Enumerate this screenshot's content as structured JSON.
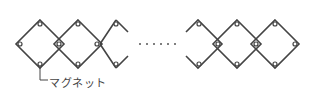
{
  "diagram": {
    "type": "magnet-diamond-chain",
    "label": "マグネット",
    "ellipsis": "・・・・・・",
    "left_group_count": 3,
    "right_group_count": 3,
    "stroke_color": "#444444"
  }
}
